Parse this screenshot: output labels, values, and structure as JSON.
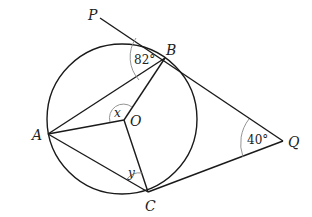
{
  "figure": {
    "type": "circle-tangent-geometry",
    "points": {
      "P": {
        "label": "P",
        "x": 100,
        "y": 18
      },
      "B": {
        "label": "B",
        "x": 165,
        "y": 58
      },
      "A": {
        "label": "A",
        "x": 48,
        "y": 134
      },
      "O": {
        "label": "O",
        "x": 124,
        "y": 120
      },
      "C": {
        "label": "C",
        "x": 148,
        "y": 192
      },
      "Q": {
        "label": "Q",
        "x": 283,
        "y": 141
      }
    },
    "circle": {
      "cx": 122,
      "cy": 119,
      "r": 75,
      "center_label": "O"
    },
    "angles": {
      "PBA": {
        "label": "82°"
      },
      "BOA": {
        "label": "x"
      },
      "ACO": {
        "label": "y"
      },
      "BQC": {
        "label": "40°"
      }
    },
    "segments": [
      "PB",
      "BQ",
      "CQ",
      "AB",
      "AO",
      "OB",
      "AC",
      "OC"
    ]
  }
}
